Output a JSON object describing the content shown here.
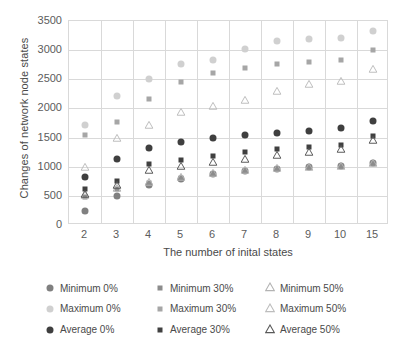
{
  "chart_data": {
    "type": "scatter",
    "title": "",
    "xlabel": "The number of inital states",
    "ylabel": "Changes of network node states",
    "categories": [
      "2",
      "3",
      "4",
      "5",
      "6",
      "7",
      "8",
      "9",
      "10",
      "15"
    ],
    "ylim": [
      0,
      3500
    ],
    "yticks": [
      0,
      500,
      1000,
      1500,
      2000,
      2500,
      3000,
      3500
    ],
    "grid": true,
    "legend_position": "bottom",
    "series": [
      {
        "name": "Minimum 0%",
        "marker": "circle",
        "color": "#808080",
        "values": [
          240,
          500,
          680,
          790,
          870,
          930,
          960,
          1000,
          1010,
          1060
        ]
      },
      {
        "name": "Minimum 30%",
        "marker": "square",
        "color": "#8c8c8c",
        "values": [
          480,
          620,
          720,
          800,
          880,
          930,
          960,
          1000,
          1010,
          1060
        ]
      },
      {
        "name": "Minimum 50%",
        "marker": "triangle",
        "color": "#b3b3b3",
        "values": [
          520,
          640,
          740,
          820,
          890,
          940,
          970,
          1000,
          1010,
          1070
        ]
      },
      {
        "name": "Maximum 0%",
        "marker": "circle",
        "color": "#d0d0d0",
        "values": [
          1720,
          2220,
          2510,
          2760,
          2830,
          3020,
          3160,
          3190,
          3200,
          3320
        ]
      },
      {
        "name": "Maximum 30%",
        "marker": "square",
        "color": "#a6a6a6",
        "values": [
          1550,
          1760,
          2170,
          2450,
          2600,
          2700,
          2760,
          2790,
          2830,
          3000
        ]
      },
      {
        "name": "Maximum 50%",
        "marker": "triangle",
        "color": "#bdbdbd",
        "values": [
          1000,
          1500,
          1720,
          1940,
          2040,
          2150,
          2300,
          2420,
          2470,
          2670
        ]
      },
      {
        "name": "Average 0%",
        "marker": "circle",
        "color": "#3f3f3f",
        "values": [
          820,
          1140,
          1320,
          1420,
          1490,
          1550,
          1580,
          1620,
          1670,
          1790
        ]
      },
      {
        "name": "Average 30%",
        "marker": "square",
        "color": "#404040",
        "values": [
          620,
          760,
          1040,
          1120,
          1190,
          1250,
          1300,
          1330,
          1370,
          1530
        ]
      },
      {
        "name": "Average 50%",
        "marker": "triangle",
        "color": "#595959",
        "values": [
          540,
          680,
          940,
          1020,
          1080,
          1140,
          1200,
          1250,
          1300,
          1450
        ]
      }
    ]
  },
  "legend": {
    "items": [
      {
        "label": "Minimum 0%",
        "marker": "circle",
        "color": "#808080"
      },
      {
        "label": "Minimum 30%",
        "marker": "square",
        "color": "#8c8c8c"
      },
      {
        "label": "Minimum 50%",
        "marker": "triangle",
        "color": "#b3b3b3"
      },
      {
        "label": "Maximum 0%",
        "marker": "circle",
        "color": "#d0d0d0"
      },
      {
        "label": "Maximum 30%",
        "marker": "square",
        "color": "#a6a6a6"
      },
      {
        "label": "Maximum 50%",
        "marker": "triangle",
        "color": "#bdbdbd"
      },
      {
        "label": "Average 0%",
        "marker": "circle",
        "color": "#3f3f3f"
      },
      {
        "label": "Average 30%",
        "marker": "square",
        "color": "#404040"
      },
      {
        "label": "Average 50%",
        "marker": "triangle",
        "color": "#595959"
      }
    ]
  }
}
